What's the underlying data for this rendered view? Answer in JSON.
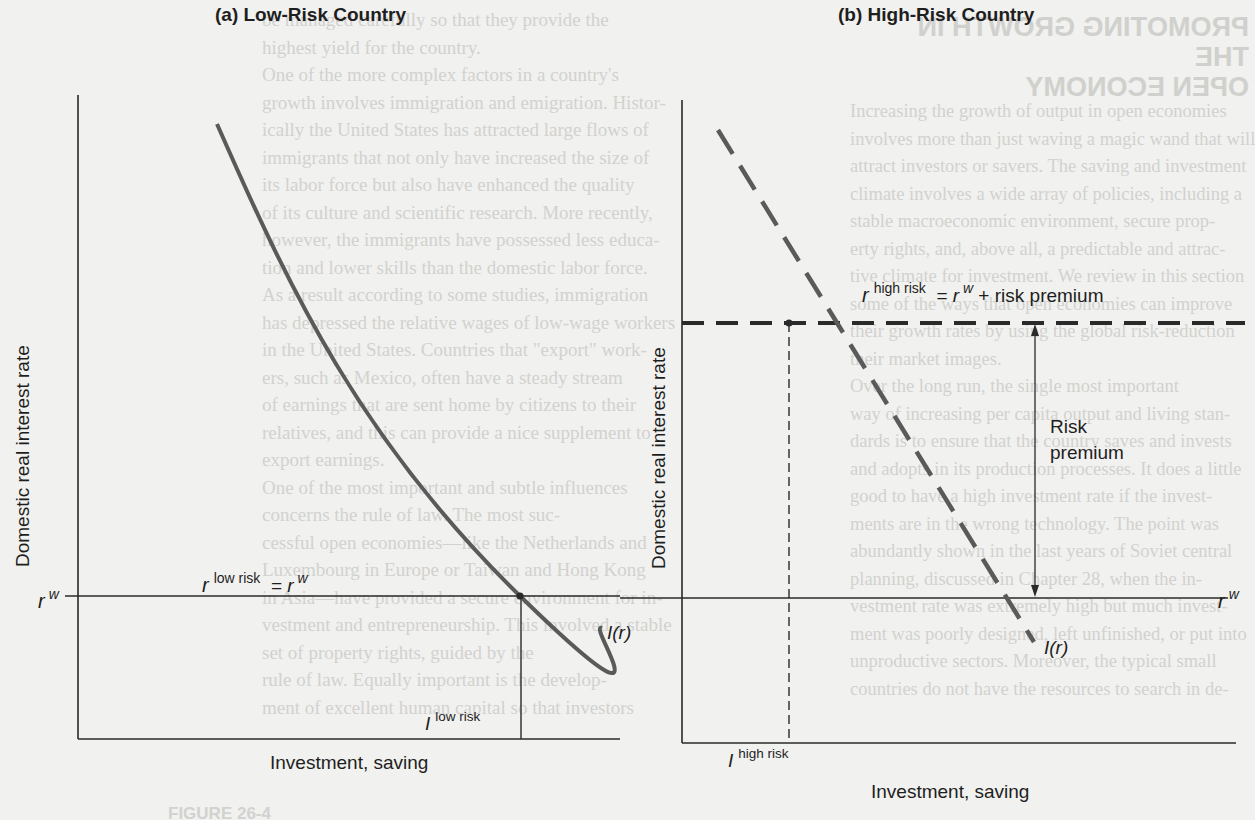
{
  "figure": {
    "panels": [
      {
        "id": "a",
        "title": "(a) Low-Risk Country",
        "ylabel": "Domestic real interest rate",
        "xlabel": "Investment, saving",
        "rate_line_label": {
          "var": "r",
          "sup": "low risk",
          "eq": "= r",
          "eq_sup": "w"
        },
        "axis_rate_label": {
          "var": "r",
          "sup": "w"
        },
        "curve_label": "I(r)",
        "investment_label": {
          "var": "I",
          "sup": "low risk"
        },
        "curve_style": "solid"
      },
      {
        "id": "b",
        "title": "(b) High-Risk Country",
        "ylabel": "Domestic real interest rate",
        "xlabel": "Investment, saving",
        "rate_line_label": {
          "var": "r",
          "sup": "high risk",
          "eq": "= r",
          "eq_sup": "w",
          "tail": " + risk premium"
        },
        "axis_rate_label": {
          "var": "r",
          "sup": "w"
        },
        "curve_label": "I(r)",
        "investment_label": {
          "var": "I",
          "sup": "high risk"
        },
        "arrow_label_line1": "Risk",
        "arrow_label_line2": "premium",
        "curve_style": "dashed"
      }
    ],
    "colors": {
      "axis": "#2a2a2a",
      "curve": "#5a5a5a",
      "background": "#f1f1ef",
      "bleed_text": "#d2d2cf"
    }
  },
  "bleed_through": {
    "left_column": [
      "be managed carefully so that they provide the",
      "highest yield for the country.",
      "    One of the more complex factors in a country's",
      "growth involves immigration and emigration. Histor-",
      "ically the United States has attracted large flows of",
      "immigrants that not only have increased the size of",
      "its labor force but also have enhanced the quality",
      "of its culture and scientific research. More recently,",
      "however, the immigrants have possessed less educa-",
      "tion and lower skills than the domestic labor force.",
      "As a result according to some studies, immigration",
      "has depressed the relative wages of low-wage workers",
      "in the United States. Countries that \"export\" work-",
      "ers, such as Mexico, often have a steady stream",
      "of earnings that are sent home by citizens to their",
      "relatives, and this can provide a nice supplement to",
      "export earnings.",
      "    One of the most important and subtle influences",
      "concerns the rule of law. The most suc-",
      "cessful open economies—like the Netherlands and",
      "Luxembourg in Europe or Taiwan and Hong Kong",
      "in Asia—have provided a secure environment for in-",
      "vestment and entrepreneurship. This involved a stable",
      "set of property rights, guided by the",
      "rule of law. Equally important is the develop-",
      "ment of excellent human capital so that investors"
    ],
    "right_heading": [
      "PROMOTING GROWTH IN THE",
      "OPEN ECONOMY"
    ],
    "right_column": [
      "Increasing the growth of output in open economies",
      "involves more than just waving a magic wand that will",
      "attract investors or savers. The saving and investment",
      "climate involves a wide array of policies, including a",
      "stable macroeconomic environment, secure prop-",
      "erty rights, and, above all, a predictable and attrac-",
      "tive climate for investment. We review in this section",
      "some of the ways that open economies can improve",
      "their growth rates by using the global risk-reduction",
      "their market images.",
      "    Over the long run, the single most important",
      "way of increasing per capita output and living stan-",
      "dards is to ensure that the country saves and invests",
      "and adopts in its production processes. It does a little",
      "good to have a high investment rate if the invest-",
      "ments are in the wrong technology. The point was",
      "abundantly shown in the last years of Soviet central",
      "planning, discussed in Chapter 28, when the in-",
      "vestment rate was extremely high but much invest-",
      "ment was poorly designed, left unfinished, or put into",
      "unproductive sectors. Moreover, the typical small",
      "countries do not have the resources to search in de-"
    ],
    "caption_fragment": "FIGURE 26-4"
  }
}
